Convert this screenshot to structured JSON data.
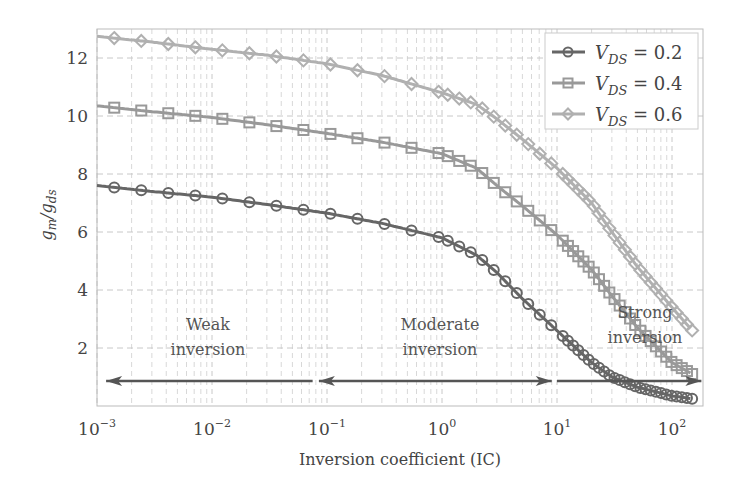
{
  "chart_data": {
    "type": "line",
    "title": "",
    "xlabel": "Inversion coefficient (IC)",
    "ylabel": "g_m/g_ds",
    "xscale": "log",
    "xlim": [
      0.001,
      186
    ],
    "ylim": [
      0,
      13
    ],
    "grid": true,
    "legend_position": "upper right",
    "x_ticks": [
      {
        "base": "10",
        "exp": "−3",
        "value": 0.001
      },
      {
        "base": "10",
        "exp": "−2",
        "value": 0.01
      },
      {
        "base": "10",
        "exp": "−1",
        "value": 0.1
      },
      {
        "base": "10",
        "exp": "0",
        "value": 1
      },
      {
        "base": "10",
        "exp": "1",
        "value": 10
      },
      {
        "base": "10",
        "exp": "2",
        "value": 100
      }
    ],
    "y_ticks": [
      2,
      4,
      6,
      8,
      10,
      12
    ],
    "x": [
      0.001,
      0.003,
      0.01,
      0.03,
      0.1,
      0.3,
      1,
      2,
      3,
      5,
      10,
      20,
      30,
      50,
      100,
      150
    ],
    "series": [
      {
        "name": "V_DS = 0.2",
        "label_main": "V",
        "label_sub": "DS",
        "label_val": " = 0.2",
        "color": "#666666",
        "marker": "circle",
        "values": [
          7.6,
          7.4,
          7.2,
          6.95,
          6.65,
          6.3,
          5.8,
          5.2,
          4.6,
          3.7,
          2.6,
          1.5,
          1.0,
          0.65,
          0.35,
          0.25
        ]
      },
      {
        "name": "V_DS = 0.4",
        "label_main": "V",
        "label_sub": "DS",
        "label_val": " = 0.4",
        "color": "#999999",
        "marker": "square",
        "values": [
          10.35,
          10.15,
          9.95,
          9.7,
          9.4,
          9.1,
          8.7,
          8.2,
          7.6,
          6.9,
          5.9,
          4.7,
          3.8,
          2.7,
          1.5,
          1.1
        ]
      },
      {
        "name": "V_DS = 0.6",
        "label_main": "V",
        "label_sub": "DS",
        "label_val": " = 0.6",
        "color": "#b0b0b0",
        "marker": "diamond",
        "values": [
          12.75,
          12.55,
          12.3,
          12.1,
          11.8,
          11.4,
          10.8,
          10.4,
          9.9,
          9.2,
          8.2,
          7.0,
          6.0,
          4.8,
          3.4,
          2.6
        ]
      }
    ],
    "annotations": [
      {
        "text_lines": [
          "Weak",
          "inversion"
        ],
        "arrow": "left",
        "x_from": 0.0012,
        "x_to": 0.075
      },
      {
        "text_lines": [
          "Moderate",
          "inversion"
        ],
        "arrow": "both",
        "x_from": 0.085,
        "x_to": 9
      },
      {
        "text_lines": [
          "Strong",
          "inversion"
        ],
        "arrow": "right",
        "x_from": 10,
        "x_to": 180
      }
    ]
  }
}
